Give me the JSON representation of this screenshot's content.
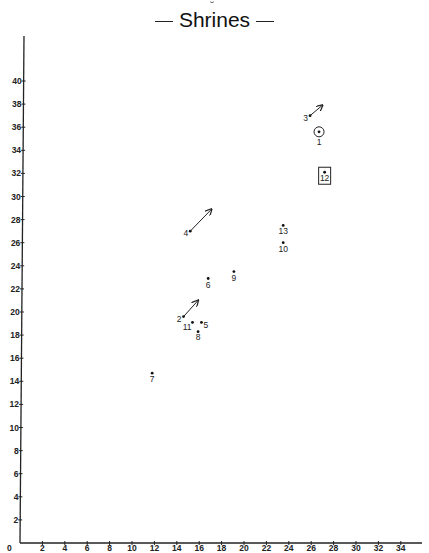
{
  "title": "Shrines",
  "chart_data": {
    "type": "scatter",
    "title": "Shrines",
    "xlabel": "",
    "ylabel": "",
    "xlim": [
      0,
      36
    ],
    "ylim": [
      0,
      44
    ],
    "x_ticks": [
      0,
      2,
      4,
      6,
      8,
      10,
      12,
      14,
      16,
      18,
      20,
      22,
      24,
      26,
      28,
      30,
      32,
      34
    ],
    "y_ticks": [
      2,
      4,
      6,
      8,
      10,
      12,
      14,
      16,
      18,
      20,
      22,
      24,
      26,
      28,
      30,
      32,
      34,
      36,
      38,
      40
    ],
    "grid": false,
    "legend": null,
    "points": [
      {
        "label": "1",
        "x": 26.7,
        "y": 35.6,
        "marker": "circled-dot"
      },
      {
        "label": "2",
        "x": 14.6,
        "y": 19.6,
        "marker": "dot-arrow",
        "arrow_to": {
          "x": 15.9,
          "y": 21.0
        }
      },
      {
        "label": "3",
        "x": 25.9,
        "y": 37.0,
        "marker": "dot-arrow",
        "arrow_to": {
          "x": 27.0,
          "y": 37.9
        }
      },
      {
        "label": "4",
        "x": 15.2,
        "y": 27.0,
        "marker": "dot-arrow",
        "arrow_to": {
          "x": 17.1,
          "y": 28.9
        }
      },
      {
        "label": "5",
        "x": 16.2,
        "y": 19.1,
        "marker": "dot"
      },
      {
        "label": "6",
        "x": 16.8,
        "y": 22.9,
        "marker": "dot"
      },
      {
        "label": "7",
        "x": 11.8,
        "y": 14.7,
        "marker": "dot"
      },
      {
        "label": "8",
        "x": 15.9,
        "y": 18.3,
        "marker": "dot"
      },
      {
        "label": "9",
        "x": 19.1,
        "y": 23.5,
        "marker": "dot"
      },
      {
        "label": "10",
        "x": 23.5,
        "y": 26.0,
        "marker": "dot"
      },
      {
        "label": "11",
        "x": 15.4,
        "y": 19.1,
        "marker": "dot"
      },
      {
        "label": "12",
        "x": 27.2,
        "y": 32.1,
        "marker": "boxed-dot"
      },
      {
        "label": "13",
        "x": 23.5,
        "y": 27.5,
        "marker": "dot"
      }
    ]
  }
}
